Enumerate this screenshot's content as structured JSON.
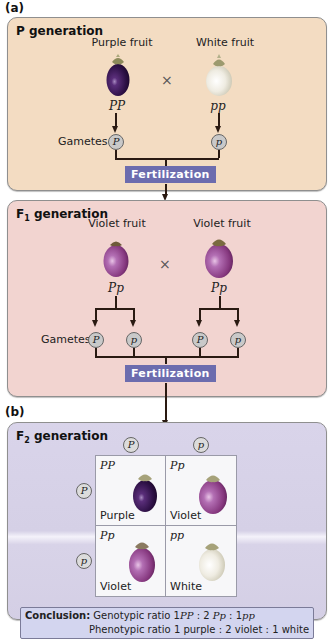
{
  "figure": {
    "part_a_label": "(a)",
    "part_b_label": "(b)",
    "colors": {
      "p_panel": "#f3dcc2",
      "f1_panel": "#f2d4d0",
      "f2_panel": "#d8d3e8",
      "fertilization_box": "#6c6cae",
      "conclusion_box": "#d3d5ef",
      "purple_fruit": "#3a1a55",
      "violet_fruit": "#9a4ea0",
      "white_fruit": "#f0eee4"
    }
  },
  "p_generation": {
    "title": "P generation",
    "left_parent": {
      "label": "Purple fruit",
      "genotype": "PP"
    },
    "cross_symbol": "×",
    "right_parent": {
      "label": "White fruit",
      "genotype": "pp"
    },
    "gametes_label": "Gametes",
    "gametes": [
      "P",
      "p"
    ],
    "fertilization_label": "Fertilization"
  },
  "f1_generation": {
    "title_main": "F",
    "title_sub": "1",
    "title_rest": " generation",
    "left_parent": {
      "label": "Violet fruit",
      "genotype": "Pp"
    },
    "cross_symbol": "×",
    "right_parent": {
      "label": "Violet fruit",
      "genotype": "Pp"
    },
    "gametes_label": "Gametes",
    "gametes": [
      "P",
      "p",
      "P",
      "p"
    ],
    "fertilization_label": "Fertilization"
  },
  "f2_generation": {
    "title_main": "F",
    "title_sub": "2",
    "title_rest": " generation",
    "column_gametes": [
      "P",
      "p"
    ],
    "row_gametes": [
      "P",
      "p"
    ],
    "punnett": [
      {
        "genotype": "PP",
        "phenotype": "Purple"
      },
      {
        "genotype": "Pp",
        "phenotype": "Violet"
      },
      {
        "genotype": "Pp",
        "phenotype": "Violet"
      },
      {
        "genotype": "pp",
        "phenotype": "White"
      }
    ]
  },
  "conclusion": {
    "label": "Conclusion:",
    "genotypic_prefix": "Genotypic ratio",
    "genotypic": [
      "1",
      "PP",
      "2",
      "Pp",
      "1",
      "pp"
    ],
    "phenotypic_prefix": "Phenotypic ratio",
    "phenotypic_text": "1 purple : 2 violet : 1 white",
    "sep": ":"
  }
}
